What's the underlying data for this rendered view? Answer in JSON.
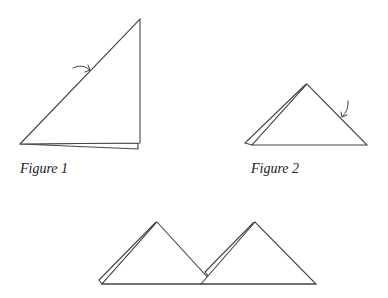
{
  "figures": [
    {
      "id": "figure-1",
      "caption": "Figure 1",
      "description": "Right triangle folded paper, two layers, arrow indicating fold along hypotenuse"
    },
    {
      "id": "figure-2",
      "caption": "Figure 2",
      "description": "Isosceles triangle with offset back layer, arrow indicating fold on right edge"
    },
    {
      "id": "figure-3",
      "caption": "",
      "description": "Two layered triangles placed side by side, overlapping"
    }
  ],
  "colors": {
    "stroke": "#444444",
    "background": "#ffffff"
  }
}
